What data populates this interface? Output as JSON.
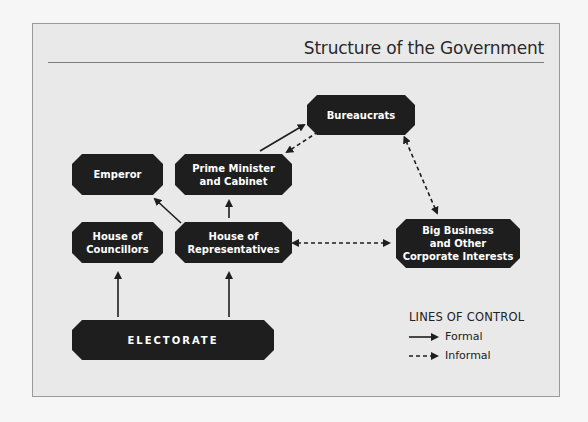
{
  "title": "Structure of the Government",
  "nodes": {
    "bureaucrats": "Bureaucrats",
    "emperor": "Emperor",
    "prime_minister": "Prime Minister\nand Cabinet",
    "councillors": "House of\nCouncillors",
    "representatives": "House of\nRepresentatives",
    "big_business": "Big Business\nand Other\nCorporate Interests",
    "electorate": "ELECTORATE"
  },
  "edges": [
    {
      "from": "prime_minister",
      "to": "bureaucrats",
      "type": "formal"
    },
    {
      "from": "bureaucrats",
      "to": "prime_minister",
      "type": "informal"
    },
    {
      "from": "bureaucrats",
      "to": "big_business",
      "type": "informal",
      "bidirectional": true
    },
    {
      "from": "representatives",
      "to": "emperor",
      "type": "formal"
    },
    {
      "from": "representatives",
      "to": "prime_minister",
      "type": "formal"
    },
    {
      "from": "representatives",
      "to": "big_business",
      "type": "informal",
      "bidirectional": true
    },
    {
      "from": "electorate",
      "to": "councillors",
      "type": "formal"
    },
    {
      "from": "electorate",
      "to": "representatives",
      "type": "formal"
    }
  ],
  "legend": {
    "title": "LINES OF CONTROL",
    "items": [
      {
        "label": "Formal",
        "style": "solid"
      },
      {
        "label": "Informal",
        "style": "dashed"
      }
    ]
  },
  "colors": {
    "node_fill": "#1e1e1e",
    "node_text": "#ffffff",
    "frame_bg": "#e9e9e9",
    "page_bg": "#f6f6f6",
    "line": "#1e1e1e"
  }
}
